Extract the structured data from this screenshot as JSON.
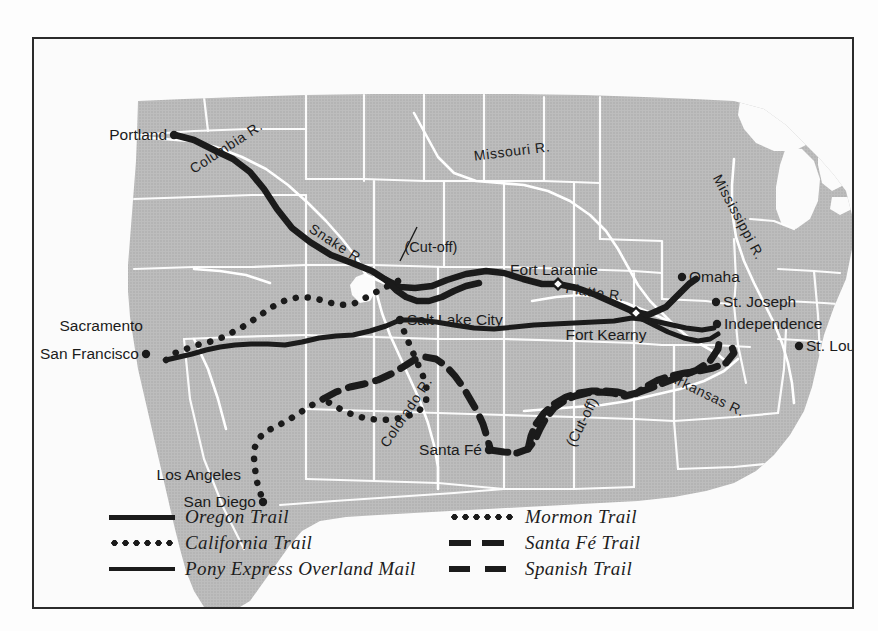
{
  "figure": {
    "domain": "Map",
    "frame_color": "#2b2b2b",
    "land_color": "#b9b9b9",
    "water_color": "#fbfbfb",
    "border_color": "#ffffff",
    "trail_color": "#1b1b1b"
  },
  "legend": {
    "left_column": [
      {
        "label": "Oregon Trail",
        "style": "solid-thick",
        "style_name": "solid-line-swatch"
      },
      {
        "label": "California Trail",
        "style": "dotted",
        "style_name": "dotted-line-swatch"
      },
      {
        "label": "Pony Express Overland Mail",
        "style": "solid-thin",
        "style_name": "solid-line-swatch"
      }
    ],
    "right_column": [
      {
        "label": "Mormon Trail",
        "style": "dotted",
        "style_name": "dotted-line-swatch"
      },
      {
        "label": "Santa Fé Trail",
        "style": "dashed",
        "style_name": "dashed-line-swatch"
      },
      {
        "label": "Spanish Trail",
        "style": "dashed-wide",
        "style_name": "dashed-line-swatch"
      }
    ]
  },
  "cities": [
    {
      "name": "Portland",
      "x": 140,
      "y": 96,
      "anchor": "right",
      "dot": true
    },
    {
      "name": "Sacramento",
      "x": 116,
      "y": 287,
      "anchor": "right",
      "dot": false
    },
    {
      "name": "San Francisco",
      "x": 112,
      "y": 315,
      "anchor": "right",
      "dot": true
    },
    {
      "name": "Los Angeles",
      "x": 214,
      "y": 436,
      "anchor": "right",
      "dot": false
    },
    {
      "name": "San Diego",
      "x": 229,
      "y": 463,
      "anchor": "right",
      "dot": true
    },
    {
      "name": "Salt Lake City",
      "x": 366,
      "y": 281,
      "anchor": "left",
      "dot": true
    },
    {
      "name": "Santa Fé",
      "x": 455,
      "y": 411,
      "anchor": "right",
      "dot": true
    },
    {
      "name": "Omaha",
      "x": 648,
      "y": 238,
      "anchor": "left",
      "dot": true
    },
    {
      "name": "St. Joseph",
      "x": 682,
      "y": 263,
      "anchor": "left",
      "dot": true
    },
    {
      "name": "Independence",
      "x": 683,
      "y": 285,
      "anchor": "left",
      "dot": true
    },
    {
      "name": "St. Louis",
      "x": 765,
      "y": 307,
      "anchor": "left",
      "dot": true
    }
  ],
  "forts": [
    {
      "name": "Fort Laramie",
      "x": 524,
      "y": 245,
      "label_x": 520,
      "label_y": 231,
      "anchor": "center"
    },
    {
      "name": "Fort Kearny",
      "x": 602,
      "y": 274,
      "label_x": 572,
      "label_y": 296,
      "anchor": "center"
    }
  ],
  "rivers": [
    {
      "name": "Columbia R.",
      "x": 192,
      "y": 108,
      "rotate": -33
    },
    {
      "name": "Snake R.",
      "x": 303,
      "y": 205,
      "rotate": 33
    },
    {
      "name": "Missouri R.",
      "x": 478,
      "y": 112,
      "rotate": -7
    },
    {
      "name": "Mississippi R.",
      "x": 705,
      "y": 178,
      "rotate": 62
    },
    {
      "name": "Platte R.",
      "x": 561,
      "y": 253,
      "rotate": 8
    },
    {
      "name": "Colorado R.",
      "x": 372,
      "y": 373,
      "rotate": -56
    },
    {
      "name": "Arkansas R.",
      "x": 673,
      "y": 355,
      "rotate": 26
    }
  ],
  "annotations": [
    {
      "name": "snake-cutoff",
      "label": "(Cut-off)",
      "x": 397,
      "y": 208,
      "rotate": 0,
      "leader_to_x": 378,
      "leader_to_y": 248
    },
    {
      "name": "santafe-cutoff",
      "label": "(Cut-off)",
      "x": 548,
      "y": 383,
      "rotate": -63,
      "leader_to_x": null,
      "leader_to_y": null
    }
  ],
  "trails": {
    "oregon": {
      "name": "Oregon Trail",
      "style": "solid-thick",
      "path": "M 141,96 L 160,101 L 180,111 L 199,120 L 216,133 L 230,150 L 243,170 L 258,189 L 276,203 L 297,216 L 318,224 L 338,232 L 352,241 L 366,248 L 381,249 L 398,247 L 413,241 L 432,235 L 452,232 L 470,234 L 489,240 L 508,245 L 524,245 L 543,249 L 562,256 L 580,264 L 598,272 L 614,276 L 632,268 L 645,255 L 655,245 L 662,240"
    },
    "oregon_cutoff": {
      "name": "Oregon Trail Cut-off",
      "style": "solid-thick",
      "path": "M 352,241 L 362,251 L 372,258 L 383,262 L 395,262 L 408,258 L 420,252 L 432,247 L 445,244"
    },
    "california": {
      "name": "California Trail",
      "style": "dotted",
      "path": "M 132,321 L 141,314 L 152,310 L 163,306 L 175,303 L 187,299 L 199,293 L 212,286 L 225,277 L 238,268 L 252,261 L 266,258 L 280,259 L 293,263 L 306,266 L 319,265 L 331,259 L 344,252 L 356,246 L 366,241 L 372,234"
    },
    "pony_express": {
      "name": "Pony Express Overland Mail",
      "style": "solid-thin",
      "path": "M 132,321 L 145,318 L 158,315 L 172,311 L 186,308 L 201,306 L 217,305 L 234,305 L 251,306 L 268,303 L 285,299 L 302,297 L 319,296 L 336,292 L 352,287 L 366,281 L 384,281 L 402,283 L 420,286 L 440,289 L 460,290 L 480,288 L 500,286 L 520,285 L 540,284 L 560,283 L 580,282 L 598,279 L 615,281 L 634,285 L 652,289 L 668,291 L 680,289"
    },
    "pony_express_branch": {
      "name": "Pony Express Branch to Independence",
      "style": "solid-thin",
      "path": "M 602,277 L 618,285 L 634,293 L 650,299 L 664,302 L 676,300 L 684,295"
    },
    "mormon": {
      "name": "Mormon Trail",
      "style": "dotted",
      "path": "M 366,281 L 371,295 L 377,309 L 383,323 L 389,337 L 393,351 L 392,363 L 385,372 L 374,377 L 361,380 L 348,381 L 335,380 L 322,377 L 310,372 L 299,366 L 289,360"
    },
    "california_south": {
      "name": "California Trail Southern Branch",
      "style": "dotted",
      "path": "M 289,360 L 278,366 L 267,373 L 256,380 L 245,386 L 235,391 L 226,398 L 221,408 L 220,419 L 221,429 L 222,438 L 224,447 L 227,456 L 230,463"
    },
    "spanish": {
      "name": "Spanish Trail",
      "style": "dashed-wide",
      "path": "M 289,360 L 302,353 L 316,348 L 330,345 L 344,341 L 357,335 L 369,328 L 380,321 L 391,318 L 402,320 L 412,327 L 421,337 L 429,348 L 436,360 L 443,372 L 449,385 L 453,398 L 456,409"
    },
    "santafe": {
      "name": "Santa Fé Trail",
      "style": "dashed",
      "path": "M 456,411 L 470,413 L 483,414 L 494,410 L 501,401 L 506,390 L 512,379 L 520,369 L 530,362 L 541,357 L 553,354 L 566,353 L 579,354 L 591,357 L 603,354 L 613,347 L 624,341 L 637,337 L 651,334 L 665,332 L 679,329 L 692,324 L 700,314 L 697,305"
    },
    "santafe_cutoff": {
      "name": "Santa Fé Trail Cut-off",
      "style": "dashed",
      "path": "M 494,410 L 497,397 L 502,385 L 510,374 L 520,365 L 532,358 L 545,354 L 558,352 L 571,352 L 584,353 L 594,356"
    },
    "santafe_to_independence": {
      "name": "Santa Fé Trail to Independence",
      "style": "dashed",
      "path": "M 603,354 L 617,349 L 632,343 L 648,337 L 663,331 L 676,322 L 684,310 L 686,299"
    }
  }
}
